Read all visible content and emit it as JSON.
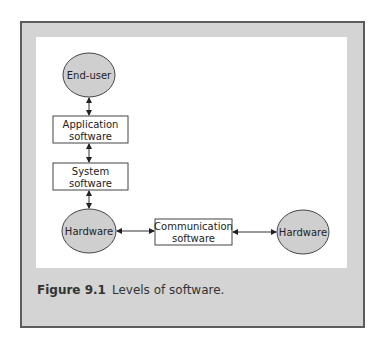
{
  "figure": {
    "caption_label": "Figure 9.1",
    "caption_text": "Levels of software."
  },
  "nodes": {
    "end_user": "End-user",
    "application": [
      "Application",
      "software"
    ],
    "system": [
      "System",
      "software"
    ],
    "hardware_left": "Hardware",
    "communication": [
      "Communication",
      "software"
    ],
    "hardware_right": "Hardware"
  },
  "colors": {
    "ellipse_fill": "#cfcfcf",
    "stroke": "#444444",
    "frame_bg": "#d4d4d4",
    "frame_border": "#5c5c5c"
  }
}
